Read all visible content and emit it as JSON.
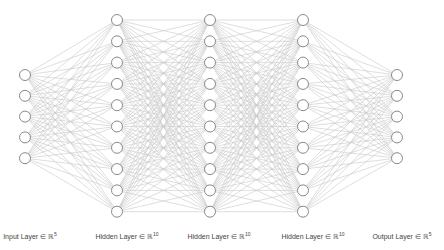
{
  "diagram": {
    "edge_color": "#c8c8c8",
    "node_stroke": "#8a8a8a",
    "node_fill": "#ffffff",
    "node_radius": 5.5,
    "layers": [
      {
        "name": "input",
        "label": "Input Layer ∈ ℝ",
        "dim": "5",
        "x": 25,
        "nodes": 5,
        "y_start": 75,
        "spacing": 20.8,
        "label_x": 30
      },
      {
        "name": "hidden-1",
        "label": "Hidden Layer ∈ ℝ",
        "dim": "10",
        "x": 117,
        "nodes": 10,
        "y_start": 20,
        "spacing": 21.3,
        "label_x": 127
      },
      {
        "name": "hidden-2",
        "label": "Hidden Layer ∈ ℝ",
        "dim": "10",
        "x": 210,
        "nodes": 10,
        "y_start": 20,
        "spacing": 21.3,
        "label_x": 219
      },
      {
        "name": "hidden-3",
        "label": "Hidden Layer ∈ ℝ",
        "dim": "10",
        "x": 303,
        "nodes": 10,
        "y_start": 20,
        "spacing": 21.3,
        "label_x": 313
      },
      {
        "name": "output",
        "label": "Output Layer ∈ ℝ",
        "dim": "5",
        "x": 397,
        "nodes": 5,
        "y_start": 75,
        "spacing": 20.8,
        "label_x": 402
      }
    ]
  }
}
